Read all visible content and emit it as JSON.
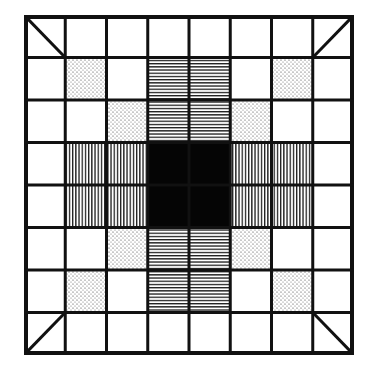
{
  "diagram": {
    "type": "grid-pattern",
    "rows": 8,
    "cols": 8,
    "colors": {
      "line": "#111111",
      "background": "#ffffff",
      "center": "#050505",
      "dots": "#333333"
    },
    "center_block": {
      "row": 3,
      "col": 3,
      "rowspan": 2,
      "colspan": 2,
      "fill": "solid-black"
    },
    "dotted_cells": [
      [
        1,
        1
      ],
      [
        1,
        6
      ],
      [
        2,
        2
      ],
      [
        2,
        5
      ],
      [
        5,
        2
      ],
      [
        5,
        5
      ],
      [
        6,
        1
      ],
      [
        6,
        6
      ]
    ],
    "horizontal_hatch_cells": [
      [
        1,
        3
      ],
      [
        1,
        4
      ],
      [
        2,
        3
      ],
      [
        2,
        4
      ],
      [
        5,
        3
      ],
      [
        5,
        4
      ],
      [
        6,
        3
      ],
      [
        6,
        4
      ]
    ],
    "vertical_hatch_cells": [
      [
        3,
        1
      ],
      [
        3,
        2
      ],
      [
        4,
        1
      ],
      [
        4,
        2
      ],
      [
        3,
        5
      ],
      [
        3,
        6
      ],
      [
        4,
        5
      ],
      [
        4,
        6
      ]
    ],
    "diagonal_cells": [
      {
        "row": 0,
        "col": 0,
        "direction": "top-left-to-bottom-right"
      },
      {
        "row": 0,
        "col": 7,
        "direction": "top-right-to-bottom-left"
      },
      {
        "row": 7,
        "col": 0,
        "direction": "bottom-left-to-top-right"
      },
      {
        "row": 7,
        "col": 7,
        "direction": "top-left-to-bottom-right"
      }
    ]
  }
}
